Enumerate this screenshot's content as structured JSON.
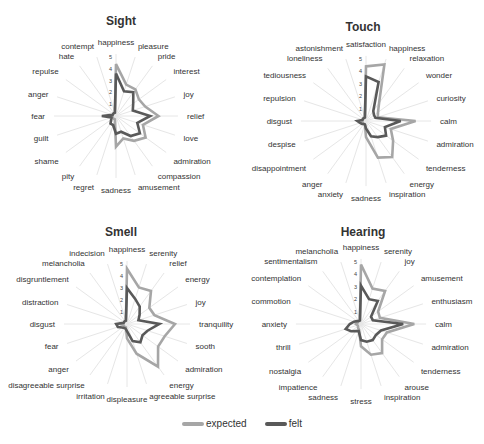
{
  "chart_data": [
    {
      "type": "radar",
      "title": "Sight",
      "rmax": 5,
      "ticks": [
        "1",
        "2",
        "3",
        "4",
        "5"
      ],
      "axes": [
        "happiness",
        "pleasure",
        "pride",
        "interest",
        "joy",
        "relief",
        "love",
        "admiration",
        "compassion",
        "amusement",
        "sadness",
        "regret",
        "pity",
        "shame",
        "guilt",
        "fear",
        "anger",
        "repulse",
        "hate",
        "contempt"
      ],
      "series": [
        {
          "name": "expected",
          "values": [
            4.4,
            2.8,
            2.8,
            2.4,
            2.6,
            3.6,
            2.4,
            3.1,
            2.6,
            2.0,
            2.6,
            0.3,
            0.3,
            0.3,
            0.3,
            0.3,
            0.3,
            0.3,
            0.3,
            0.3
          ]
        },
        {
          "name": "felt",
          "values": [
            3.6,
            2.2,
            2.5,
            1.8,
            1.5,
            2.9,
            1.9,
            2.5,
            2.1,
            1.4,
            1.5,
            0.8,
            0.8,
            0.5,
            0.4,
            1.2,
            0.3,
            0.3,
            0.3,
            0.3
          ]
        }
      ]
    },
    {
      "type": "radar",
      "title": "Touch",
      "rmax": 5,
      "ticks": [
        "1",
        "2",
        "3",
        "4",
        "5"
      ],
      "axes": [
        "satisfaction",
        "happiness",
        "relaxation",
        "wonder",
        "curiosity",
        "calm",
        "admiration",
        "tenderness",
        "energy",
        "inspiration",
        "sadness",
        "anxiety",
        "anger",
        "disappointment",
        "despise",
        "disgust",
        "repulsion",
        "tediousness",
        "loneliness",
        "astonishment"
      ],
      "series": [
        {
          "name": "expected",
          "values": [
            4.4,
            4.8,
            1.8,
            1.2,
            1.0,
            4.0,
            2.1,
            2.7,
            3.6,
            3.1,
            1.3,
            0.3,
            0.3,
            0.3,
            0.3,
            0.3,
            0.3,
            0.3,
            0.3,
            0.3
          ]
        },
        {
          "name": "felt",
          "values": [
            3.6,
            3.3,
            1.0,
            0.8,
            0.8,
            2.8,
            1.6,
            2.0,
            1.6,
            1.3,
            0.6,
            0.3,
            0.3,
            0.4,
            0.5,
            0.7,
            0.3,
            0.3,
            0.3,
            0.3
          ]
        }
      ]
    },
    {
      "type": "radar",
      "title": "Smell",
      "rmax": 5,
      "ticks": [
        "1",
        "2",
        "3",
        "4",
        "5"
      ],
      "axes": [
        "happiness",
        "serenity",
        "relief",
        "energy",
        "joy",
        "tranquility",
        "sooth",
        "admiration",
        "energy",
        "agreeable surprise",
        "displeasure",
        "irritation",
        "disagreeable surprise",
        "anger",
        "fear",
        "disgust",
        "distraction",
        "disgruntlement",
        "melancholia",
        "indecision"
      ],
      "series": [
        {
          "name": "expected",
          "values": [
            4.6,
            3.2,
            3.4,
            2.3,
            2.4,
            4.0,
            3.3,
            3.2,
            4.4,
            2.6,
            1.2,
            0.3,
            0.3,
            0.3,
            0.3,
            0.6,
            0.3,
            0.3,
            0.3,
            0.3
          ]
        },
        {
          "name": "felt",
          "values": [
            3.0,
            2.2,
            1.8,
            1.3,
            1.0,
            2.7,
            1.8,
            1.6,
            1.9,
            1.5,
            0.6,
            0.4,
            0.4,
            0.5,
            0.8,
            0.9,
            0.3,
            0.3,
            0.3,
            0.3
          ]
        }
      ]
    },
    {
      "type": "radar",
      "title": "Hearing",
      "rmax": 5,
      "ticks": [
        "1",
        "2",
        "3",
        "4",
        "5"
      ],
      "axes": [
        "happiness",
        "serenity",
        "joy",
        "amusement",
        "enthusiasm",
        "calm",
        "admiration",
        "tenderness",
        "arouse",
        "inspiration",
        "stress",
        "sadness",
        "impatience",
        "nostalgia",
        "thrill",
        "anxiety",
        "commotion",
        "contemplation",
        "sentimentalism",
        "melancholia"
      ],
      "series": [
        {
          "name": "expected",
          "values": [
            4.8,
            3.0,
            3.3,
            1.7,
            1.6,
            4.3,
            2.2,
            2.1,
            2.9,
            2.6,
            1.8,
            0.5,
            0.4,
            0.3,
            0.3,
            0.4,
            0.3,
            0.3,
            0.3,
            0.3
          ]
        },
        {
          "name": "felt",
          "values": [
            3.1,
            2.1,
            2.3,
            1.0,
            1.0,
            3.4,
            1.7,
            1.5,
            1.6,
            1.5,
            1.3,
            0.6,
            0.7,
            1.0,
            1.3,
            0.9,
            0.6,
            0.4,
            0.3,
            0.3
          ]
        }
      ]
    }
  ],
  "legend": {
    "items": [
      {
        "label": "expected",
        "color": "#a6a6a6"
      },
      {
        "label": "felt",
        "color": "#595959"
      }
    ]
  },
  "colors": {
    "grid": "#e6e6e6",
    "label": "#333333",
    "tick": "#444444"
  }
}
